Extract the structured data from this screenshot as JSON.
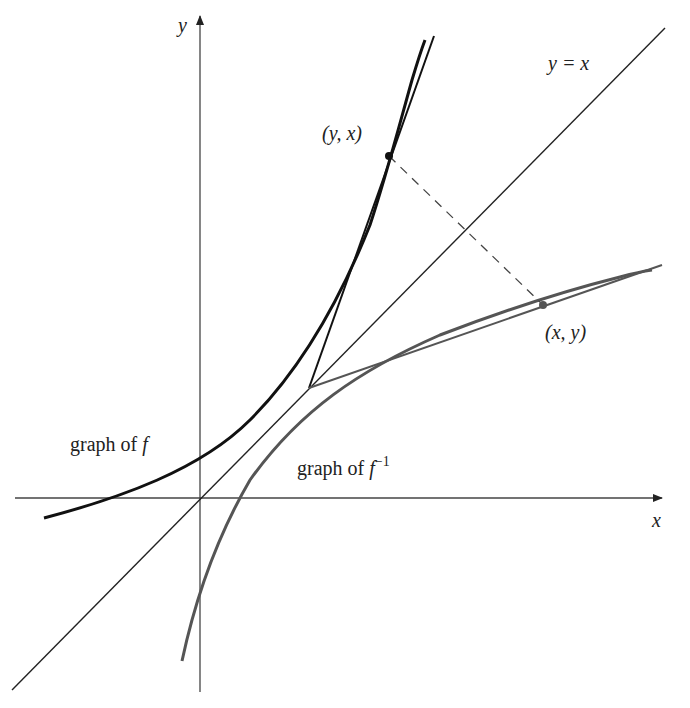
{
  "diagram": {
    "colors": {
      "background": "#ffffff",
      "axes": "#333333",
      "f_curve": "#111111",
      "f_inverse_curve": "#555555",
      "identity_line": "#222222",
      "dashed_segment": "#444444",
      "text": "#222222"
    },
    "axes": {
      "x_label": "x",
      "y_label": "y"
    },
    "labels": {
      "identity_line": "y = x",
      "point_on_f": "(y, x)",
      "point_on_f_inverse": "(x, y)",
      "graph_f_prefix": "graph of ",
      "graph_f_symbol": "f",
      "graph_f_inverse_prefix": "graph of ",
      "graph_f_inverse_symbol": "f",
      "graph_f_inverse_exponent": "−1"
    },
    "elements": [
      {
        "name": "graph of f",
        "kind": "curve",
        "style": "solid, thick, black"
      },
      {
        "name": "graph of f^-1",
        "kind": "curve",
        "style": "solid, thick, gray"
      },
      {
        "name": "y = x",
        "kind": "line",
        "style": "solid, thin"
      },
      {
        "name": "tangent to f at (y, x)",
        "kind": "line",
        "style": "solid"
      },
      {
        "name": "tangent to f^-1 at (x, y)",
        "kind": "line",
        "style": "solid, gray"
      },
      {
        "name": "segment joining (y, x) and (x, y)",
        "kind": "line",
        "style": "dashed, perpendicular to y = x"
      }
    ]
  }
}
